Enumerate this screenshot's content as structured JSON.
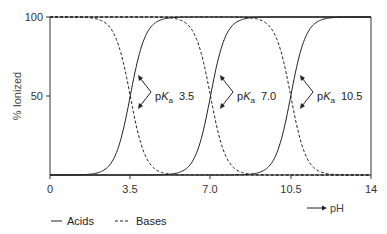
{
  "chart_data": {
    "type": "line",
    "title": "",
    "xlabel": "pH",
    "ylabel": "% Ionized",
    "xlim": [
      0,
      14
    ],
    "ylim": [
      0,
      100
    ],
    "x_ticks": [
      "0",
      "3.5",
      "7.0",
      "10.5",
      "14"
    ],
    "y_ticks": [
      "100",
      "50"
    ],
    "grid": false,
    "legend": {
      "position": "bottom-left",
      "entries": [
        {
          "label": "Acids",
          "style": "solid"
        },
        {
          "label": "Bases",
          "style": "dashed"
        }
      ]
    },
    "series": [
      {
        "name": "Acid pKa 3.5",
        "kind": "acid",
        "style": "solid",
        "pKa": 3.5,
        "x": [
          0,
          1,
          2,
          2.5,
          3,
          3.5,
          4,
          4.5,
          5,
          6,
          7
        ],
        "y": [
          0.03,
          0.3,
          3.1,
          9.1,
          24,
          50,
          76,
          91,
          97,
          99.7,
          100
        ]
      },
      {
        "name": "Acid pKa 7.0",
        "kind": "acid",
        "style": "solid",
        "pKa": 7.0,
        "x": [
          4,
          5,
          5.5,
          6,
          6.5,
          7,
          7.5,
          8,
          8.5,
          9,
          10
        ],
        "y": [
          0.1,
          1,
          3.1,
          9.1,
          24,
          50,
          76,
          91,
          97,
          99,
          100
        ]
      },
      {
        "name": "Acid pKa 10.5",
        "kind": "acid",
        "style": "solid",
        "pKa": 10.5,
        "x": [
          7.5,
          8.5,
          9,
          9.5,
          10,
          10.5,
          11,
          11.5,
          12,
          13,
          14
        ],
        "y": [
          0.1,
          1,
          3.1,
          9.1,
          24,
          50,
          76,
          91,
          97,
          99.7,
          100
        ]
      },
      {
        "name": "Base pKa 3.5",
        "kind": "base",
        "style": "dashed",
        "pKa": 3.5,
        "x": [
          0,
          1,
          2,
          2.5,
          3,
          3.5,
          4,
          4.5,
          5,
          6,
          7
        ],
        "y": [
          100,
          99.7,
          97,
          91,
          76,
          50,
          24,
          9.1,
          3.1,
          0.3,
          0.03
        ]
      },
      {
        "name": "Base pKa 7.0",
        "kind": "base",
        "style": "dashed",
        "pKa": 7.0,
        "x": [
          4,
          5,
          5.5,
          6,
          6.5,
          7,
          7.5,
          8,
          8.5,
          9,
          10
        ],
        "y": [
          100,
          99,
          97,
          91,
          76,
          50,
          24,
          9.1,
          3.1,
          1,
          0.1
        ]
      },
      {
        "name": "Base pKa 10.5",
        "kind": "base",
        "style": "dashed",
        "pKa": 10.5,
        "x": [
          7.5,
          8.5,
          9,
          9.5,
          10,
          10.5,
          11,
          11.5,
          12,
          13,
          14
        ],
        "y": [
          100,
          99,
          97,
          91,
          76,
          50,
          24,
          9.1,
          3.1,
          0.3,
          0.03
        ]
      }
    ],
    "annotations": [
      {
        "text": "pKa 3.5",
        "prefix": "p",
        "italic": "K",
        "subscript": "a",
        "value": "3.5",
        "x": 3.5,
        "y": 50
      },
      {
        "text": "pKa 7.0",
        "prefix": "p",
        "italic": "K",
        "subscript": "a",
        "value": "7.0",
        "x": 7.0,
        "y": 50
      },
      {
        "text": "pKa 10.5",
        "prefix": "p",
        "italic": "K",
        "subscript": "a",
        "value": "10.5",
        "x": 10.5,
        "y": 50
      }
    ]
  },
  "labels": {
    "ylabel": "% Ionized",
    "xlabel": "pH",
    "x_ticks": [
      "0",
      "3.5",
      "7.0",
      "10.5",
      "14"
    ],
    "y_ticks": [
      "100",
      "50"
    ],
    "legend_acids": "Acids",
    "legend_bases": "Bases",
    "pka_prefix": "p",
    "pka_k": "K",
    "pka_sub": "a",
    "pka_values": [
      "3.5",
      "7.0",
      "10.5"
    ]
  },
  "colors": {
    "line": "#222222",
    "axis": "#333333",
    "background": "#ffffff"
  }
}
